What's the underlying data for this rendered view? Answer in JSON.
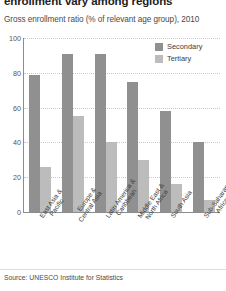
{
  "title": "enrollment vary among regions",
  "subtitle": "Gross enrollment ratio (% of relevant age group), 2010",
  "source": "Source: UNESCO Institute for Statistics",
  "legend": {
    "items": [
      {
        "label": "Secondary",
        "color": "#909090"
      },
      {
        "label": "Tertiary",
        "color": "#bcbcbc"
      }
    ]
  },
  "axis": {
    "yticks": [
      "0",
      "20",
      "40",
      "60",
      "80",
      "100"
    ]
  },
  "xlabels": [
    {
      "line1": "East Asia &",
      "line2": "Pacific"
    },
    {
      "line1": "Europe &",
      "line2": "Central Asia"
    },
    {
      "line1": "Latin America &",
      "line2": "Caribbean"
    },
    {
      "line1": "Middle East &",
      "line2": "North Africa"
    },
    {
      "line1": "South Asia",
      "line2": ""
    },
    {
      "line1": "Sub-Saharan",
      "line2": "Africa"
    }
  ],
  "chart_data": {
    "type": "bar",
    "title": "enrollment vary among regions",
    "subtitle": "Gross enrollment ratio (% of relevant age group), 2010",
    "xlabel": "",
    "ylabel": "",
    "ylim": [
      0,
      100
    ],
    "yticks": [
      0,
      20,
      40,
      60,
      80,
      100
    ],
    "grid": true,
    "legend_position": "top-right",
    "categories": [
      "East Asia & Pacific",
      "Europe & Central Asia",
      "Latin America & Caribbean",
      "Middle East & North Africa",
      "South Asia",
      "Sub-Saharan Africa"
    ],
    "series": [
      {
        "name": "Secondary",
        "color": "#909090",
        "values": [
          79,
          91,
          91,
          75,
          58,
          40
        ]
      },
      {
        "name": "Tertiary",
        "color": "#bcbcbc",
        "values": [
          26,
          55,
          40,
          30,
          16,
          7
        ]
      }
    ],
    "source": "Source: UNESCO Institute for Statistics"
  }
}
